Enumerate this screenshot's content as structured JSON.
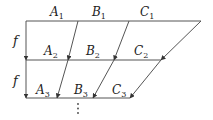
{
  "diagram": {
    "type": "commutative-map-diagram",
    "rows": [
      {
        "y": 21,
        "x1": 26,
        "x2": 201,
        "labels": [
          {
            "base": "A",
            "sub": "1",
            "x": 50,
            "y": 16
          },
          {
            "base": "B",
            "sub": "1",
            "x": 92,
            "y": 16
          },
          {
            "base": "C",
            "sub": "1",
            "x": 140,
            "y": 16
          }
        ]
      },
      {
        "y": 60,
        "x1": 26,
        "x2": 161,
        "labels": [
          {
            "base": "A",
            "sub": "2",
            "x": 44,
            "y": 55
          },
          {
            "base": "B",
            "sub": "2",
            "x": 86,
            "y": 55
          },
          {
            "base": "C",
            "sub": "2",
            "x": 134,
            "y": 55
          }
        ]
      },
      {
        "y": 98,
        "x1": 26,
        "x2": 130,
        "labels": [
          {
            "base": "A",
            "sub": "3",
            "x": 36,
            "y": 94
          },
          {
            "base": "B",
            "sub": "3",
            "x": 74,
            "y": 94
          },
          {
            "base": "C",
            "sub": "3",
            "x": 112,
            "y": 94
          }
        ]
      }
    ],
    "map_label": "f",
    "f_labels": [
      {
        "text": "f",
        "x": 13,
        "y": 45
      },
      {
        "text": "f",
        "x": 13,
        "y": 85
      }
    ],
    "arrows": [
      {
        "name": "f-arrow-1",
        "x1": 26,
        "y1": 21,
        "x2": 26,
        "y2": 60
      },
      {
        "name": "f-arrow-2",
        "x1": 26,
        "y1": 60,
        "x2": 26,
        "y2": 98
      },
      {
        "name": "diag-b1-a2",
        "x1": 78,
        "y1": 21,
        "x2": 68,
        "y2": 60
      },
      {
        "name": "diag-b2-a3",
        "x1": 68,
        "y1": 60,
        "x2": 57,
        "y2": 98
      },
      {
        "name": "diag-c1-b2",
        "x1": 129,
        "y1": 21,
        "x2": 114,
        "y2": 60
      },
      {
        "name": "diag-c2-b3",
        "x1": 114,
        "y1": 60,
        "x2": 93,
        "y2": 98
      },
      {
        "name": "diag-end1-c2",
        "x1": 201,
        "y1": 21,
        "x2": 161,
        "y2": 60
      },
      {
        "name": "diag-end2-c3",
        "x1": 161,
        "y1": 60,
        "x2": 130,
        "y2": 98
      }
    ],
    "continuation": "⋮",
    "ellipsis_dots": [
      {
        "x": 78,
        "y": 104
      },
      {
        "x": 78,
        "y": 108.5
      },
      {
        "x": 78,
        "y": 113
      }
    ],
    "colors": {
      "line": "#555555",
      "text": "#222222",
      "background": "#ffffff"
    }
  }
}
